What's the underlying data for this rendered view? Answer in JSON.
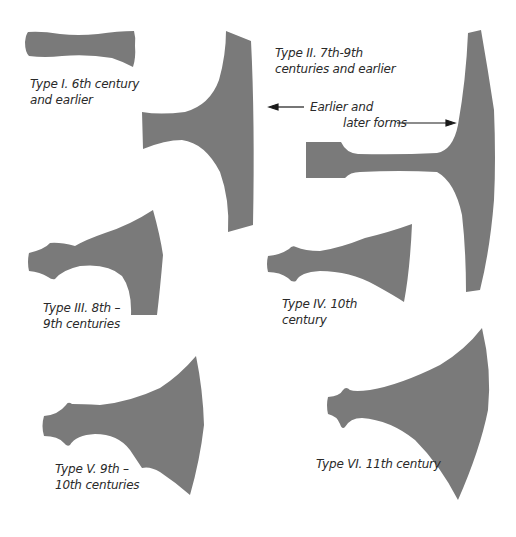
{
  "figure": {
    "fill_color": "#7a7a7a",
    "text_color": "#2a2a2a",
    "background": "#ffffff"
  },
  "axes": [
    {
      "id": "type-1",
      "label_lines": [
        "Type I. 6th century",
        "and earlier"
      ]
    },
    {
      "id": "type-2",
      "label_lines": [
        "Type II. 7th-9th",
        "centuries and earlier"
      ]
    },
    {
      "id": "type-3",
      "label_lines": [
        "Type III. 8th –",
        "9th centuries"
      ]
    },
    {
      "id": "type-4",
      "label_lines": [
        "Type IV. 10th",
        "century"
      ]
    },
    {
      "id": "type-5",
      "label_lines": [
        "Type V. 9th –",
        "10th centuries"
      ]
    },
    {
      "id": "type-6",
      "label_lines": [
        "Type VI. 11th century"
      ]
    }
  ],
  "annotations": {
    "earlier": "Earlier and",
    "later": "later forms"
  }
}
